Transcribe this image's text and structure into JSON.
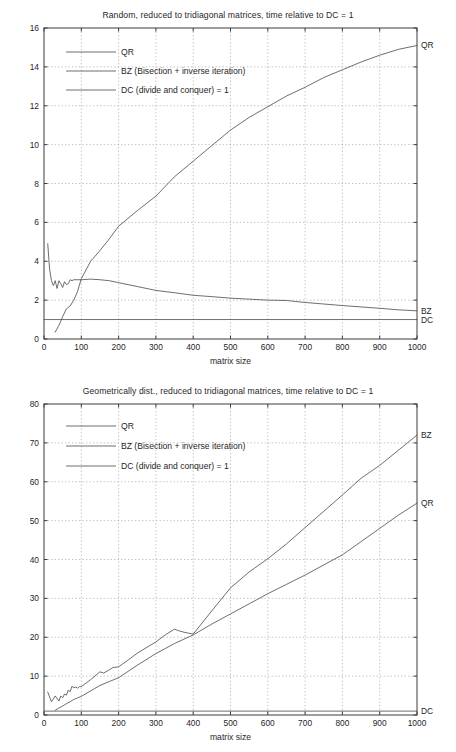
{
  "page": {
    "background": "#ffffff",
    "line_color": "#545454",
    "axis_color": "#3c3c3c",
    "grid_color": "#9a9a9a"
  },
  "figures": [
    {
      "id": "figure-random",
      "title": "Random, reduced to tridiagonal matrices, time relative to DC = 1",
      "xlabel": "matrix size",
      "ylabel": "",
      "legend": [
        {
          "label": "QR",
          "series": "QR"
        },
        {
          "label": "BZ (Bisection + inverse iteration)",
          "series": "BZ"
        },
        {
          "label": "DC (divide and conquer) = 1",
          "series": "DC"
        }
      ],
      "end_labels": [
        {
          "label": "QR",
          "value": 15.1
        },
        {
          "label": "BZ",
          "value": 1.45
        },
        {
          "label": "DC",
          "value": 1.0
        }
      ],
      "chart_data": {
        "type": "line",
        "title": "Random, reduced to tridiagonal matrices, time relative to DC = 1",
        "xlabel": "matrix size",
        "ylabel": "",
        "xlim": [
          0,
          1000
        ],
        "ylim": [
          0,
          16
        ],
        "xticks": [
          0,
          100,
          200,
          300,
          400,
          500,
          600,
          700,
          800,
          900,
          1000
        ],
        "yticks": [
          0,
          2,
          4,
          6,
          8,
          10,
          12,
          14,
          16
        ],
        "grid": true,
        "legend_position": "upper-left-inside",
        "series": [
          {
            "name": "QR",
            "x": [
              30,
              40,
              50,
              60,
              70,
              80,
              90,
              100,
              125,
              150,
              175,
              200,
              250,
              300,
              350,
              400,
              450,
              500,
              550,
              600,
              650,
              700,
              750,
              800,
              850,
              900,
              950,
              1000
            ],
            "values": [
              0.35,
              0.7,
              1.15,
              1.55,
              1.7,
              2.0,
              2.45,
              3.1,
              4.0,
              4.55,
              5.15,
              5.8,
              6.6,
              7.35,
              8.35,
              9.15,
              9.95,
              10.75,
              11.4,
              11.95,
              12.5,
              12.95,
              13.45,
              13.85,
              14.25,
              14.6,
              14.9,
              15.1
            ]
          },
          {
            "name": "BZ",
            "x": [
              10,
              15,
              20,
              25,
              30,
              35,
              40,
              45,
              50,
              55,
              60,
              65,
              70,
              75,
              80,
              90,
              100,
              125,
              150,
              175,
              200,
              250,
              300,
              350,
              400,
              450,
              500,
              550,
              600,
              650,
              700,
              750,
              800,
              850,
              900,
              950,
              1000
            ],
            "values": [
              4.9,
              3.6,
              3.0,
              2.75,
              3.0,
              2.6,
              3.0,
              2.85,
              2.65,
              2.95,
              2.8,
              2.85,
              3.05,
              3.0,
              3.05,
              3.05,
              3.05,
              3.08,
              3.05,
              3.0,
              2.9,
              2.7,
              2.5,
              2.38,
              2.25,
              2.18,
              2.1,
              2.05,
              2.0,
              1.98,
              1.88,
              1.8,
              1.72,
              1.65,
              1.58,
              1.5,
              1.45
            ]
          },
          {
            "name": "DC",
            "x": [
              0,
              1000
            ],
            "values": [
              1.0,
              1.0
            ]
          }
        ]
      }
    },
    {
      "id": "figure-geometric",
      "title": "Geometrically dist., reduced to tridiagonal matrices, time relative to DC = 1",
      "xlabel": "matrix size",
      "ylabel": "",
      "legend": [
        {
          "label": "QR",
          "series": "QR"
        },
        {
          "label": "BZ (Bisection + inverse iteration)",
          "series": "BZ"
        },
        {
          "label": "DC (divide and conquer) = 1",
          "series": "DC"
        }
      ],
      "end_labels": [
        {
          "label": "BZ",
          "value": 72.0
        },
        {
          "label": "QR",
          "value": 54.5
        },
        {
          "label": "DC",
          "value": 1.0
        }
      ],
      "chart_data": {
        "type": "line",
        "title": "Geometrically dist., reduced to tridiagonal matrices, time relative to DC = 1",
        "xlabel": "matrix size",
        "ylabel": "",
        "xlim": [
          0,
          1000
        ],
        "ylim": [
          0,
          80
        ],
        "xticks": [
          0,
          100,
          200,
          300,
          400,
          500,
          600,
          700,
          800,
          900,
          1000
        ],
        "yticks": [
          0,
          10,
          20,
          30,
          40,
          50,
          60,
          70,
          80
        ],
        "grid": true,
        "legend_position": "upper-left-inside",
        "series": [
          {
            "name": "QR",
            "x": [
              30,
              40,
              50,
              60,
              70,
              80,
              90,
              100,
              125,
              150,
              175,
              200,
              250,
              300,
              350,
              400,
              450,
              500,
              550,
              600,
              650,
              700,
              750,
              800,
              850,
              900,
              950,
              1000
            ],
            "values": [
              1.2,
              1.8,
              2.3,
              2.9,
              3.4,
              4.0,
              4.4,
              4.8,
              6.2,
              7.6,
              8.6,
              9.6,
              12.8,
              15.8,
              18.4,
              20.6,
              23.4,
              26.0,
              28.6,
              31.2,
              33.6,
              36.0,
              38.6,
              41.2,
              44.6,
              48.0,
              51.4,
              54.5
            ]
          },
          {
            "name": "BZ",
            "x": [
              10,
              20,
              30,
              40,
              45,
              50,
              55,
              60,
              65,
              70,
              75,
              80,
              85,
              90,
              95,
              100,
              125,
              150,
              160,
              175,
              185,
              200,
              225,
              250,
              300,
              325,
              350,
              360,
              375,
              400,
              450,
              500,
              550,
              600,
              650,
              700,
              750,
              800,
              850,
              900,
              950,
              1000
            ],
            "values": [
              5.9,
              3.4,
              4.9,
              3.6,
              4.9,
              4.4,
              5.4,
              5.1,
              6.4,
              6.0,
              7.4,
              7.0,
              7.2,
              6.9,
              7.3,
              7.3,
              9.1,
              11.1,
              10.8,
              11.6,
              12.2,
              12.4,
              14.1,
              15.9,
              18.8,
              20.6,
              22.1,
              21.7,
              21.3,
              20.8,
              26.8,
              32.7,
              36.8,
              40.2,
              44.0,
              48.2,
              52.4,
              56.6,
              60.9,
              64.2,
              68.1,
              72.0
            ]
          },
          {
            "name": "DC",
            "x": [
              0,
              1000
            ],
            "values": [
              1.0,
              1.0
            ]
          }
        ]
      }
    }
  ]
}
